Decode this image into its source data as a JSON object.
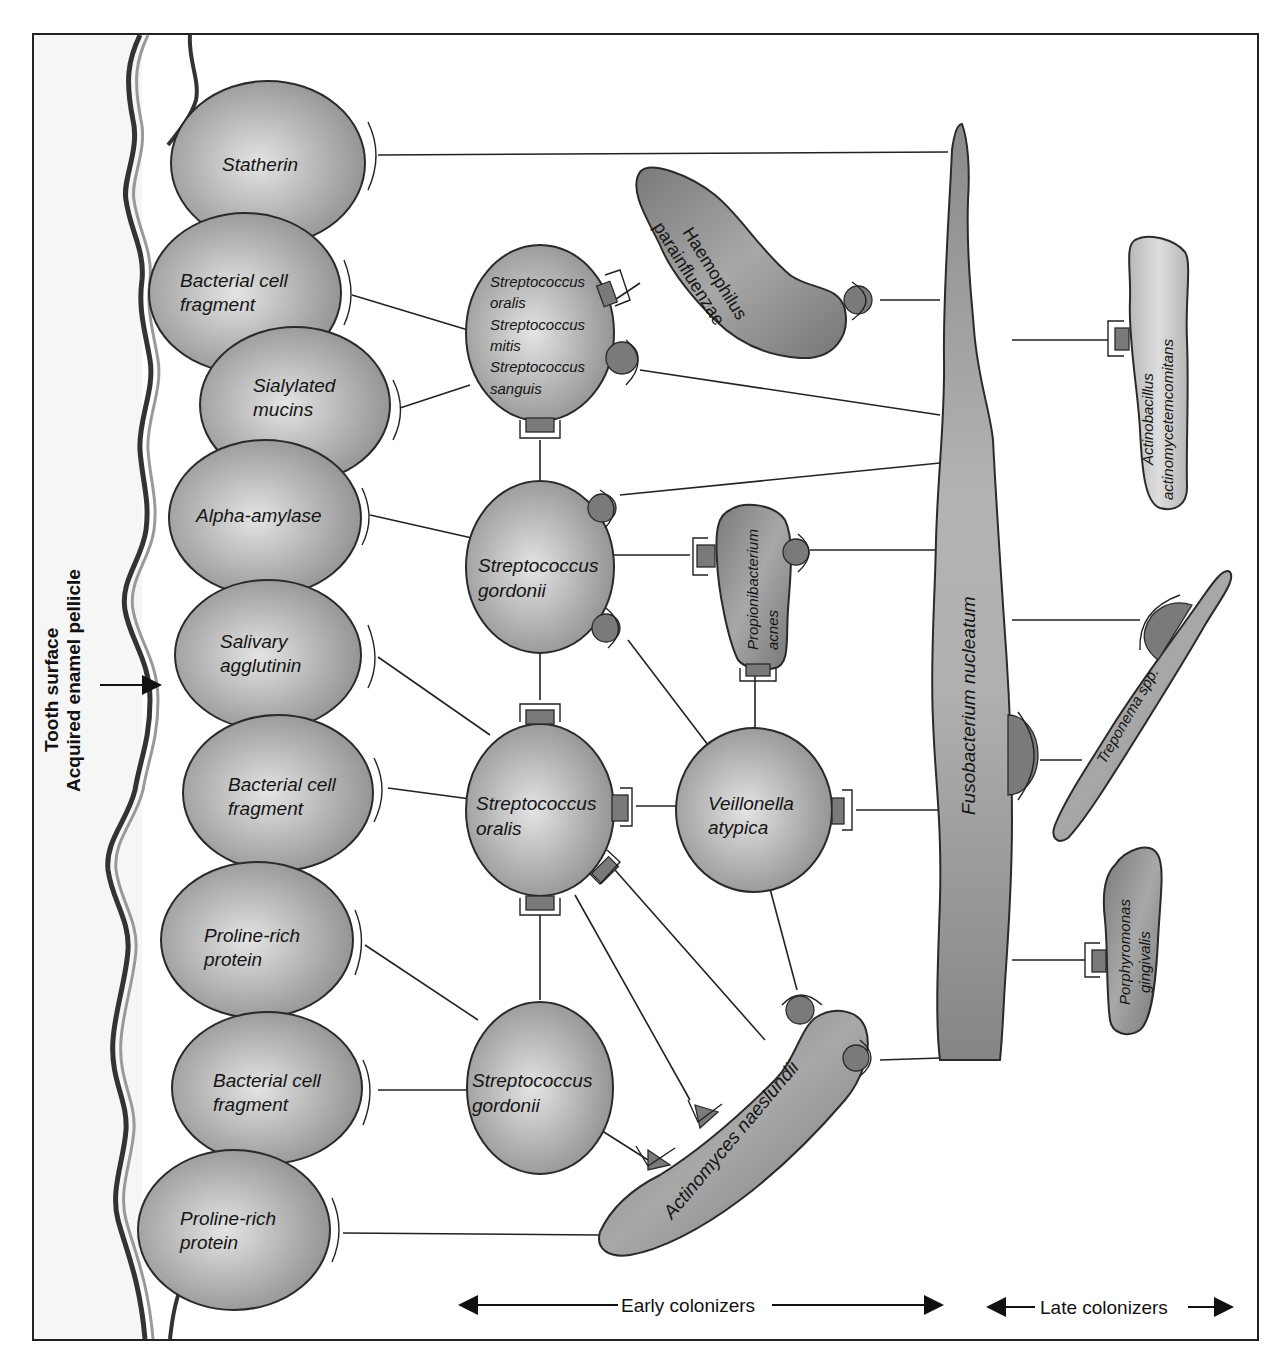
{
  "figure": {
    "side_labels": {
      "tooth_surface": "Tooth surface",
      "pellicle": "Acquired enamel pellicle"
    },
    "pellicle_components": [
      {
        "id": "statherin",
        "lines": [
          "Statherin"
        ]
      },
      {
        "id": "bacterial-cell-fragment-1",
        "lines": [
          "Bacterial cell",
          "fragment"
        ]
      },
      {
        "id": "sialylated-mucins",
        "lines": [
          "Sialylated",
          "mucins"
        ]
      },
      {
        "id": "alpha-amylase",
        "lines": [
          "Alpha-amylase"
        ]
      },
      {
        "id": "salivary-agglutinin",
        "lines": [
          "Salivary",
          "agglutinin"
        ]
      },
      {
        "id": "bacterial-cell-fragment-2",
        "lines": [
          "Bacterial cell",
          "fragment"
        ]
      },
      {
        "id": "proline-rich-protein-1",
        "lines": [
          "Proline-rich",
          "protein"
        ]
      },
      {
        "id": "bacterial-cell-fragment-3",
        "lines": [
          "Bacterial cell",
          "fragment"
        ]
      },
      {
        "id": "proline-rich-protein-2",
        "lines": [
          "Proline-rich",
          "protein"
        ]
      }
    ],
    "early_colonizers": [
      {
        "id": "strep-group",
        "lines": [
          "Streptococcus",
          "oralis",
          "Streptococcus",
          "mitis",
          "Streptococcus",
          "sanguis"
        ]
      },
      {
        "id": "strep-gordonii-1",
        "lines": [
          "Streptococcus",
          "gordonii"
        ]
      },
      {
        "id": "strep-oralis",
        "lines": [
          "Streptococcus",
          "oralis"
        ]
      },
      {
        "id": "strep-gordonii-2",
        "lines": [
          "Streptococcus",
          "gordonii"
        ]
      },
      {
        "id": "veillonella",
        "lines": [
          "Veillonella",
          "atypica"
        ]
      },
      {
        "id": "propionibacterium",
        "lines": [
          "Propionibacterium",
          "acnes"
        ]
      },
      {
        "id": "haemophilus",
        "lines": [
          "Haemophilus",
          "parainfluenzae"
        ]
      },
      {
        "id": "actinomyces",
        "lines": [
          "Actinomyces naeslundii"
        ]
      }
    ],
    "bridge": {
      "id": "fusobacterium",
      "label": "Fusobacterium nucleatum"
    },
    "late_colonizers": [
      {
        "id": "actinobacillus",
        "lines": [
          "Actinobacillus",
          "actinomycetemcomitans"
        ]
      },
      {
        "id": "treponema",
        "lines": [
          "Treponema spp."
        ]
      },
      {
        "id": "porphyromonas",
        "lines": [
          "Porphyromonas",
          "gingivalis"
        ]
      }
    ],
    "legend": {
      "early": "Early colonizers",
      "late": "Late colonizers"
    },
    "colors": {
      "cell_fill": "#a9a9a9",
      "cell_highlight": "#e2e2e2",
      "dark_bacterium": "#7d7d7d",
      "light_bacterium": "#c4c4c4",
      "line": "#222222"
    }
  }
}
